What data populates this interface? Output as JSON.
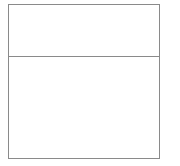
{
  "document": {
    "background_color": "#ffffff",
    "width": 180,
    "height": 166
  },
  "frame": {
    "name": "two-row-table",
    "border_color": "#8a8a8a",
    "border_width_px": 1,
    "fill_color": "#ffffff",
    "left_px": 8,
    "top_px": 4,
    "width_px": 152,
    "height_px": 155,
    "divider": {
      "orientation": "horizontal",
      "color": "#8a8a8a",
      "offset_from_top_px": 52
    },
    "rows": [
      {
        "index": 0,
        "name": "top-cell",
        "height_px": 52,
        "text": ""
      },
      {
        "index": 1,
        "name": "bottom-cell",
        "height_px": 101,
        "text": ""
      }
    ]
  }
}
